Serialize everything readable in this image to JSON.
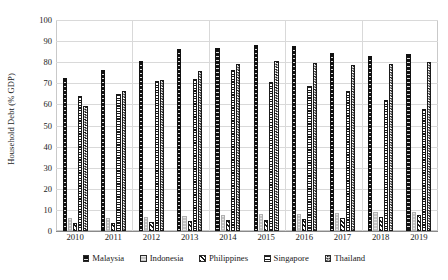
{
  "chart_data": {
    "type": "bar",
    "title": "",
    "subtitle": "",
    "xlabel": "",
    "ylabel": "Household Debt (% GDP)",
    "ylim": [
      0,
      100
    ],
    "ytick_step": 10,
    "yticks": [
      0,
      10,
      20,
      30,
      40,
      50,
      60,
      70,
      80,
      90,
      100
    ],
    "grid": true,
    "grid_axis": "both",
    "legend_position": "bottom",
    "categories": [
      "2010",
      "2011",
      "2012",
      "2013",
      "2014",
      "2015",
      "2016",
      "2017",
      "2018",
      "2019"
    ],
    "series": [
      {
        "name": "Malaysia",
        "pattern": "solid-black",
        "color": "#111111",
        "values": [
          72.4,
          76.2,
          80.5,
          86.4,
          86.8,
          88.1,
          87.5,
          84.3,
          83.0,
          84.0
        ]
      },
      {
        "name": "Indonesia",
        "pattern": "light-gray-dotted",
        "color": "#c4c4c4",
        "values": [
          6.2,
          6.4,
          6.8,
          7.2,
          7.6,
          7.9,
          8.1,
          8.4,
          8.8,
          9.1
        ]
      },
      {
        "name": "Philippines",
        "pattern": "diagonal-stripes",
        "color": "#1a1a1a",
        "values": [
          3.8,
          4.0,
          4.3,
          4.6,
          5.0,
          5.4,
          5.8,
          6.2,
          6.8,
          7.4
        ]
      },
      {
        "name": "Singapore",
        "pattern": "horizontal-lines",
        "color": "#1a1a1a",
        "values": [
          63.8,
          65.0,
          71.0,
          72.0,
          76.5,
          70.5,
          68.9,
          66.4,
          62.0,
          57.8
        ]
      },
      {
        "name": "Thailand",
        "pattern": "checkerboard",
        "color": "#1a1a1a",
        "values": [
          59.3,
          66.2,
          71.8,
          76.0,
          79.2,
          80.8,
          79.8,
          78.8,
          79.2,
          80.1
        ]
      }
    ]
  },
  "legend": {
    "items": [
      {
        "label": "Malaysia"
      },
      {
        "label": "Indonesia"
      },
      {
        "label": "Philippines"
      },
      {
        "label": "Singapore"
      },
      {
        "label": "Thailand"
      }
    ]
  }
}
